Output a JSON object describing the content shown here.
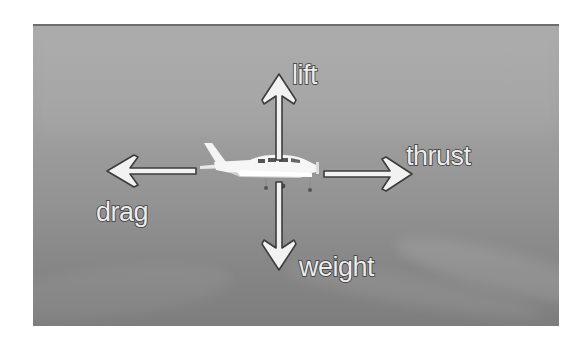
{
  "diagram": {
    "forces": [
      {
        "id": "lift",
        "label": "lift",
        "direction": "up"
      },
      {
        "id": "weight",
        "label": "weight",
        "direction": "down"
      },
      {
        "id": "thrust",
        "label": "thrust",
        "direction": "right"
      },
      {
        "id": "drag",
        "label": "drag",
        "direction": "left"
      }
    ],
    "colors": {
      "arrow_fill": "#f2f2f2",
      "arrow_outline": "#3c3c3c",
      "background_top": "#a9a9a9",
      "background_bottom": "#7d7d7d"
    }
  }
}
